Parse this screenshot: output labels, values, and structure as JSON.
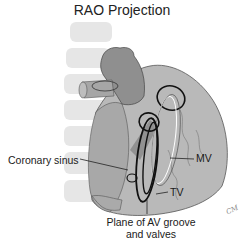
{
  "title": "RAO Projection",
  "labels": {
    "coronary_sinus": "Coronary sinus",
    "mv": "MV",
    "tv": "TV",
    "plane_line1": "Plane of AV groove",
    "plane_line2": "and valves"
  },
  "signature": "CM",
  "colors": {
    "vertebra": "#e6e6e6",
    "heart_body": "#b5b5b5",
    "heart_dark": "#8f8f8f",
    "outline": "#111111",
    "background": "#ffffff"
  }
}
